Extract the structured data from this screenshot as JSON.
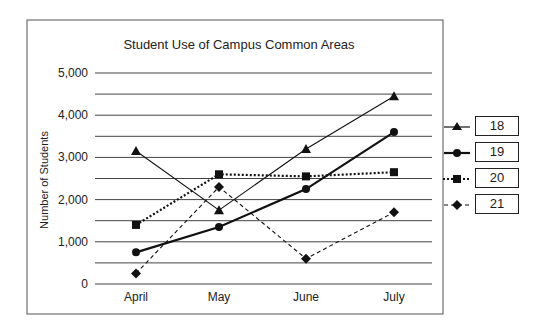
{
  "chart_data": {
    "type": "line",
    "title": "Student Use of Campus Common Areas",
    "xlabel": "",
    "ylabel": "Number of Students",
    "categories": [
      "April",
      "May",
      "June",
      "July"
    ],
    "ylim": [
      0,
      5000
    ],
    "yticks": [
      0,
      1000,
      2000,
      3000,
      4000,
      5000
    ],
    "ytick_labels": [
      "0",
      "1,000",
      "2,000",
      "3,000",
      "4,000",
      "5,000"
    ],
    "grid": true,
    "grid_step_minor": 500,
    "legend_position": "right",
    "series": [
      {
        "name": "18",
        "marker": "triangle",
        "line": "solid-thin",
        "values": [
          3150,
          1750,
          3200,
          4450
        ]
      },
      {
        "name": "19",
        "marker": "circle",
        "line": "solid-thick",
        "values": [
          750,
          1350,
          2250,
          3600
        ]
      },
      {
        "name": "20",
        "marker": "square",
        "line": "dotted",
        "values": [
          1400,
          2600,
          2550,
          2650
        ]
      },
      {
        "name": "21",
        "marker": "diamond",
        "line": "dashed",
        "values": [
          250,
          2300,
          600,
          1700
        ]
      }
    ]
  },
  "legend": {
    "items": [
      {
        "label": "18"
      },
      {
        "label": "19"
      },
      {
        "label": "20"
      },
      {
        "label": "21"
      }
    ]
  }
}
